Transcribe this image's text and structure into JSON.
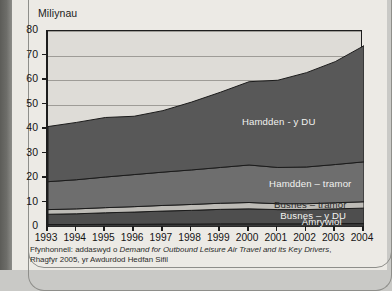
{
  "chart_data": {
    "type": "area",
    "stacked": true,
    "title": "",
    "ylabel": "Miliynau",
    "xlabel": "",
    "ylim": [
      0,
      80
    ],
    "ytick_step": 10,
    "yticks": [
      "0",
      "10",
      "20",
      "30",
      "40",
      "50",
      "60",
      "70",
      "80"
    ],
    "grid": true,
    "legend_position": "inline-labels",
    "categories": [
      "1993",
      "1994",
      "1995",
      "1996",
      "1997",
      "1998",
      "1999",
      "2000",
      "2001",
      "2002",
      "2003",
      "2004"
    ],
    "series": [
      {
        "name": "Amrywiol",
        "color": "#3a3a3a",
        "values": [
          1.0,
          1.0,
          1.1,
          1.1,
          1.2,
          1.2,
          1.3,
          1.3,
          1.3,
          1.3,
          1.4,
          1.4
        ]
      },
      {
        "name": "Busnes – y DU",
        "color": "#4e4e4e",
        "values": [
          4.2,
          4.4,
          4.7,
          5.0,
          5.3,
          5.6,
          5.9,
          6.1,
          5.8,
          5.8,
          6.0,
          6.3
        ]
      },
      {
        "name": "Busnes – tramor",
        "color": "#bdbbb6",
        "values": [
          1.9,
          2.0,
          2.1,
          2.2,
          2.3,
          2.4,
          2.5,
          2.6,
          2.4,
          2.4,
          2.5,
          2.6
        ]
      },
      {
        "name": "Hamdden – tramor",
        "color": "#6e6e6e",
        "values": [
          11.4,
          11.9,
          12.5,
          13.1,
          13.6,
          14.1,
          14.6,
          15.3,
          14.8,
          15.0,
          15.6,
          16.3
        ]
      },
      {
        "name": "Hamdden - y DU",
        "color": "#585858",
        "values": [
          22.5,
          23.4,
          24.3,
          23.8,
          25.1,
          27.7,
          30.7,
          34.0,
          35.6,
          38.5,
          42.0,
          47.4
        ]
      }
    ],
    "stack_tops": [
      41.0,
      42.7,
      44.7,
      45.2,
      47.5,
      51.0,
      55.0,
      59.3,
      59.9,
      63.0,
      67.5,
      74.0
    ],
    "source_prefix": "Ffynhonnell: addaswyd o ",
    "source_italic": "Demand for Outbound Leisure Air Travel and its Key Drivers",
    "source_suffix": ", Rhagfyr 2005, yr Awdurdod Hedfan Sifil",
    "labels_inline": [
      {
        "text": "Hamdden - y DU",
        "series": "Hamdden - y DU"
      },
      {
        "text": "Hamdden – tramor",
        "series": "Hamdden – tramor"
      },
      {
        "text": "Busnes – tramor",
        "series": "Busnes – tramor"
      },
      {
        "text": "Busnes – y DU",
        "series": "Busnes – y DU"
      },
      {
        "text": "Amrywiol",
        "series": "Amrywiol"
      }
    ]
  }
}
